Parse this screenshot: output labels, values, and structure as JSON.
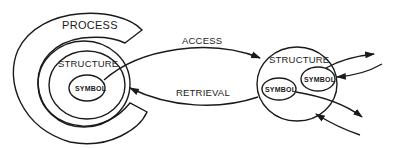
{
  "diagram": {
    "left": {
      "outer_label": "PROCESS",
      "middle_label": "STRUCTURE",
      "inner_label": "SYMBOL"
    },
    "arrows": {
      "top_label": "ACCESS",
      "bottom_label": "RETRIEVAL"
    },
    "right": {
      "container_label": "STRUCTURE",
      "symbol_left_label": "SYMBOL",
      "symbol_right_label": "SYMBOL"
    },
    "colors": {
      "line": "#1a1a1a",
      "background": "#ffffff"
    }
  }
}
